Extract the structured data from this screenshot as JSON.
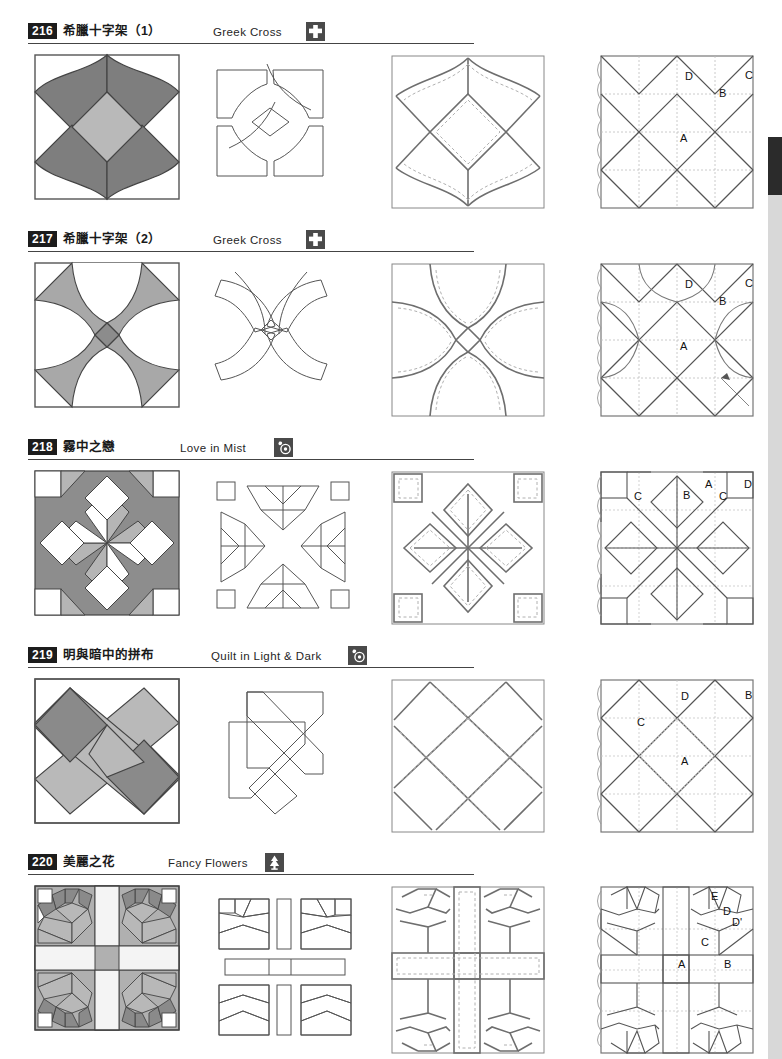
{
  "page": {
    "width": 782,
    "height": 1059,
    "background": "#ffffff",
    "edge_tab_color": "#2b2b2b",
    "edge_strip_color": "#d8d8d8"
  },
  "palette": {
    "dark_gray": "#7e7e7e",
    "mid_gray": "#9d9d9d",
    "light_gray": "#b9b9b9",
    "pale_gray": "#cccccc",
    "white": "#ffffff",
    "outline": "#4a4a4a",
    "dashed": "#9a9a9a",
    "label_badge_bg": "#1c1c1c",
    "icon_bg": "#4a4a4a"
  },
  "columns": {
    "col1_caption": "finished-block",
    "col2_caption": "template-pieces",
    "col3_caption": "seam-allowance-diagram",
    "col4_caption": "piecing-label-diagram"
  },
  "sections": [
    {
      "number": "216",
      "title_cn": "希臘十字架（1）",
      "title_en": "Greek Cross",
      "icon": "cross-icon",
      "en_left": 185,
      "icon_left": 278,
      "labels": [
        "A",
        "B",
        "C",
        "D"
      ],
      "label_positions": [
        {
          "text": "A",
          "x": 83,
          "y": 90
        },
        {
          "text": "B",
          "x": 122,
          "y": 45
        },
        {
          "text": "C",
          "x": 148,
          "y": 27
        },
        {
          "text": "D",
          "x": 88,
          "y": 28
        }
      ]
    },
    {
      "number": "217",
      "title_cn": "希臘十字架（2）",
      "title_en": "Greek Cross",
      "icon": "cross-icon",
      "en_left": 185,
      "icon_left": 278,
      "labels": [
        "A",
        "B",
        "C",
        "D"
      ],
      "label_positions": [
        {
          "text": "A",
          "x": 83,
          "y": 90
        },
        {
          "text": "B",
          "x": 122,
          "y": 45
        },
        {
          "text": "C",
          "x": 148,
          "y": 27
        },
        {
          "text": "D",
          "x": 88,
          "y": 28
        }
      ]
    },
    {
      "number": "218",
      "title_cn": "霧中之戀",
      "title_en": "Love in Mist",
      "icon": "flower-swirl-icon",
      "en_left": 152,
      "icon_left": 246,
      "labels": [
        "A",
        "B",
        "C",
        "C",
        "D"
      ],
      "label_positions": [
        {
          "text": "A",
          "x": 108,
          "y": 20
        },
        {
          "text": "B",
          "x": 86,
          "y": 31
        },
        {
          "text": "C",
          "x": 37,
          "y": 32
        },
        {
          "text": "C",
          "x": 122,
          "y": 32
        },
        {
          "text": "D",
          "x": 147,
          "y": 20
        }
      ]
    },
    {
      "number": "219",
      "title_cn": "明與暗中的拼布",
      "title_en": "Quilt in Light & Dark",
      "icon": "flower-swirl-icon",
      "en_left": 183,
      "icon_left": 320,
      "labels": [
        "A",
        "B",
        "C",
        "D"
      ],
      "label_positions": [
        {
          "text": "A",
          "x": 84,
          "y": 89
        },
        {
          "text": "B",
          "x": 148,
          "y": 23
        },
        {
          "text": "C",
          "x": 40,
          "y": 50
        },
        {
          "text": "D",
          "x": 84,
          "y": 24
        }
      ]
    },
    {
      "number": "220",
      "title_cn": "美麗之花",
      "title_en": "Fancy Flowers",
      "icon": "tree-icon",
      "en_left": 140,
      "icon_left": 237,
      "labels": [
        "A",
        "B",
        "C",
        "D",
        "D'",
        "E"
      ],
      "label_positions": [
        {
          "text": "E",
          "x": 114,
          "y": 17
        },
        {
          "text": "D",
          "x": 126,
          "y": 32
        },
        {
          "text": "D'",
          "x": 137,
          "y": 43
        },
        {
          "text": "C",
          "x": 104,
          "y": 63
        },
        {
          "text": "A",
          "x": 81,
          "y": 85
        },
        {
          "text": "B",
          "x": 127,
          "y": 85
        }
      ]
    }
  ],
  "section_tops": [
    22,
    230,
    438,
    646,
    853
  ]
}
